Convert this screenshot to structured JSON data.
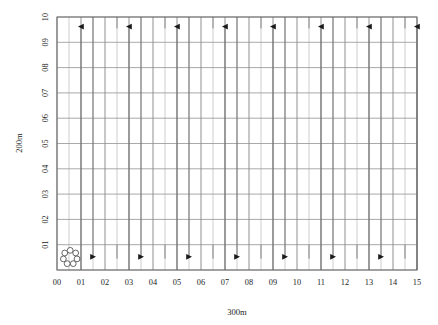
{
  "figure": {
    "type": "grid-plan-diagram",
    "background_color": "#ffffff"
  },
  "chart_data": {
    "type": "scatter",
    "title": "",
    "xlabel": "300m",
    "ylabel": "200m",
    "grid": true,
    "legend": false,
    "xlim": [
      0,
      15
    ],
    "ylim": [
      0,
      10
    ],
    "x_ticks": [
      "00",
      "01",
      "02",
      "03",
      "04",
      "05",
      "06",
      "07",
      "08",
      "09",
      "10",
      "11",
      "12",
      "13",
      "14",
      "15"
    ],
    "x_tick_values": [
      0,
      1,
      2,
      3,
      4,
      5,
      6,
      7,
      8,
      9,
      10,
      11,
      12,
      13,
      14,
      15
    ],
    "y_ticks": [
      "01",
      "02",
      "03",
      "04",
      "05",
      "06",
      "07",
      "08",
      "09",
      "10"
    ],
    "y_tick_values": [
      1,
      2,
      3,
      4,
      5,
      6,
      7,
      8,
      9,
      10
    ],
    "series": [
      {
        "name": "up-flow-lines",
        "marker": "up-arrow",
        "direction": "up",
        "arrow_head_y": 9.62,
        "line_y_start": 0,
        "line_y_end": 9.62,
        "x": [
          1,
          3,
          5,
          7,
          9,
          11,
          13,
          15
        ]
      },
      {
        "name": "down-flow-lines",
        "marker": "down-arrow",
        "direction": "down",
        "arrow_head_y": 0.52,
        "line_y_start": 10,
        "line_y_end": 0.52,
        "x": [
          1.5,
          3.5,
          5.5,
          7.5,
          9.5,
          11.5,
          13.5
        ]
      },
      {
        "name": "minor-tick-stubs",
        "marker": "short-line",
        "direction": "none",
        "x": [
          2.5,
          4.5,
          6.5,
          8.5,
          10.5,
          12.5,
          14.5
        ],
        "top_stub_y_start": 10,
        "top_stub_y_end": 9.55,
        "bottom_stub_y_start": 1,
        "bottom_stub_y_end": 0.45
      },
      {
        "name": "node-cluster",
        "marker": "circle-rosette",
        "x": [
          0.55
        ],
        "y": [
          0.5
        ],
        "node_count": 7
      }
    ],
    "gridlines": {
      "vertical_major_x": [
        0,
        1,
        2,
        3,
        4,
        5,
        6,
        7,
        8,
        9,
        10,
        11,
        12,
        13,
        14,
        15
      ],
      "vertical_minor_x": [
        0.5,
        1.5,
        2.5,
        3.5,
        4.5,
        5.5,
        6.5,
        7.5,
        8.5,
        9.5,
        10.5,
        11.5,
        12.5,
        13.5,
        14.5
      ],
      "horizontal_major_y": [
        0,
        1,
        2,
        3,
        4,
        5,
        6,
        7,
        8,
        9,
        10
      ]
    }
  },
  "colors": {
    "frame": "#6f6f6f",
    "grid_major_vertical": "#8a8a8a",
    "grid_minor_vertical": "#b9b9b9",
    "grid_horizontal": "#9a9a9a",
    "flow_line": "#6a6a6a",
    "arrow_head": "#1a1a1a",
    "node_outline": "#4d4d4d",
    "text": "#1c1c1c"
  },
  "axes": {
    "x_title": "300m",
    "y_title": "200m"
  }
}
